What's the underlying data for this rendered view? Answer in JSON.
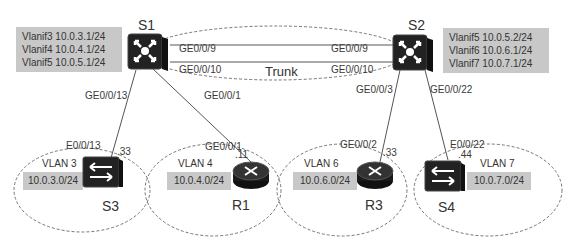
{
  "colors": {
    "ip_box_bg": "#c8c8c8",
    "device_dark": "#1e1e1e",
    "line": "#555555",
    "dashed": "#666666"
  },
  "core": {
    "s1": {
      "name": "S1",
      "vlanifs": [
        "Vlanif3 10.0.3.1/24",
        "Vlanif4 10.0.4.1/24",
        "Vlanif5 10.0.5.1/24"
      ]
    },
    "s2": {
      "name": "S2",
      "vlanifs": [
        "Vlanif5 10.0.5.2/24",
        "Vlanif6 10.0.6.1/24",
        "Vlanif7 10.0.7.1/24"
      ]
    },
    "trunk": {
      "label": "Trunk",
      "s1_ports": [
        "GE0/0/9",
        "GE0/0/10"
      ],
      "s2_ports": [
        "GE0/0/9",
        "GE0/0/10"
      ]
    }
  },
  "links": {
    "s1_s3": {
      "upstream_port": "GE0/0/13",
      "downstream_port": "E0/0/13",
      "host": ".33"
    },
    "s1_r1": {
      "upstream_port": "GE0/0/1",
      "downstream_port": "GE0/0/1",
      "host": ".11"
    },
    "s2_r3": {
      "upstream_port": "GE0/0/3",
      "downstream_port": "GE0/0/2",
      "host": ".33"
    },
    "s2_s4": {
      "upstream_port": "GE0/0/22",
      "downstream_port": "E0/0/22",
      "host": ".44"
    }
  },
  "access": [
    {
      "name": "S3",
      "type": "switch",
      "vlan": "VLAN 3",
      "network": "10.0.3.0/24"
    },
    {
      "name": "R1",
      "type": "router",
      "vlan": "VLAN 4",
      "network": "10.0.4.0/24"
    },
    {
      "name": "R3",
      "type": "router",
      "vlan": "VLAN 6",
      "network": "10.0.6.0/24"
    },
    {
      "name": "S4",
      "type": "switch",
      "vlan": "VLAN 7",
      "network": "10.0.7.0/24"
    }
  ]
}
